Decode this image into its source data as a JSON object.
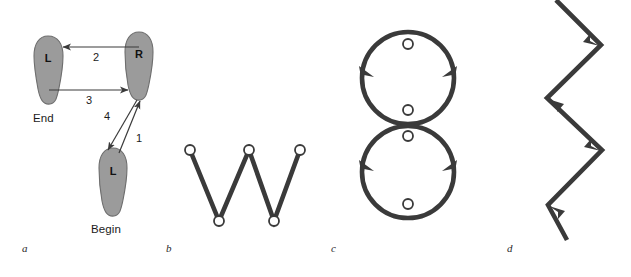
{
  "figure": {
    "title": "",
    "background": "#ffffff",
    "panels": [
      {
        "id": "a",
        "label": "a",
        "type": "footprint-gait-diagram",
        "description": "Two-footprint stepping sequence with four numbered movement arrows",
        "footprints": [
          {
            "name": "left-foot-end",
            "letter": "L",
            "caption": "End",
            "x": 48,
            "y": 68
          },
          {
            "name": "right-foot",
            "letter": "R",
            "caption": "",
            "x": 140,
            "y": 63
          },
          {
            "name": "left-foot-begin",
            "letter": "L",
            "caption": "Begin",
            "x": 113,
            "y": 180
          }
        ],
        "captions": [
          {
            "name": "end-caption",
            "text": "End"
          },
          {
            "name": "begin-caption",
            "text": "Begin"
          }
        ],
        "arrows": [
          {
            "name": "arrow-1",
            "number": "1",
            "from": "left-foot-begin",
            "to": "right-foot",
            "direction": "up-right"
          },
          {
            "name": "arrow-2",
            "number": "2",
            "from": "right-foot",
            "to": "left-foot-end",
            "direction": "left"
          },
          {
            "name": "arrow-3",
            "number": "3",
            "from": "left-foot-end",
            "to": "right-foot",
            "direction": "right"
          },
          {
            "name": "arrow-4",
            "number": "4",
            "from": "right-foot",
            "to": "left-foot-begin",
            "direction": "down-left"
          }
        ],
        "foot_fill": "#9b9b9b",
        "foot_stroke": "#6a6a6a",
        "arrow_color": "#3a3a3a"
      },
      {
        "id": "b",
        "label": "b",
        "type": "zigzag-with-nodes",
        "description": "W-shaped zigzag path with five open circular nodes",
        "nodes": [
          {
            "name": "node-1",
            "x": 190,
            "y": 150
          },
          {
            "name": "node-2",
            "x": 219,
            "y": 221
          },
          {
            "name": "node-3",
            "x": 249,
            "y": 150
          },
          {
            "name": "node-4",
            "x": 274,
            "y": 221
          },
          {
            "name": "node-5",
            "x": 300,
            "y": 150
          }
        ],
        "stroke": "#3a3a3a",
        "stroke_width": 4.5,
        "node_radius": 5
      },
      {
        "id": "c",
        "label": "c",
        "type": "figure-eight-loops",
        "description": "Two stacked circular loops forming a figure-eight with directional arrowheads",
        "loops": [
          {
            "name": "upper-loop",
            "cx": 408,
            "cy": 78,
            "r": 46
          },
          {
            "name": "lower-loop",
            "cx": 408,
            "cy": 172,
            "r": 46
          }
        ],
        "nodes": [
          {
            "name": "node-upper-top",
            "x": 408,
            "y": 44
          },
          {
            "name": "node-upper-bottom",
            "x": 408,
            "y": 110
          },
          {
            "name": "node-lower-top",
            "x": 408,
            "y": 136
          },
          {
            "name": "node-lower-bottom",
            "x": 408,
            "y": 204
          }
        ],
        "arrowheads": [
          {
            "name": "arrowhead-upper-left",
            "direction": "up"
          },
          {
            "name": "arrowhead-upper-right",
            "direction": "up"
          },
          {
            "name": "arrowhead-lower-left",
            "direction": "up"
          },
          {
            "name": "arrowhead-lower-right",
            "direction": "up"
          }
        ],
        "stroke": "#3a3a3a",
        "stroke_width": 4.5,
        "node_radius": 5
      },
      {
        "id": "d",
        "label": "d",
        "type": "zigzag-arrow-path",
        "description": "Vertical zigzag path with upward-pointing arrowheads at each turn",
        "vertices": [
          {
            "name": "vertex-1",
            "x": 561,
            "y": 232
          },
          {
            "name": "vertex-2",
            "x": 548,
            "y": 205
          },
          {
            "name": "vertex-3",
            "x": 602,
            "y": 150
          },
          {
            "name": "vertex-4",
            "x": 547,
            "y": 98
          },
          {
            "name": "vertex-5",
            "x": 601,
            "y": 45
          },
          {
            "name": "vertex-6",
            "x": 556,
            "y": 2
          }
        ],
        "arrowheads": [
          {
            "name": "arrowhead-lower",
            "direction": "up-left"
          },
          {
            "name": "arrowhead-mid-low",
            "direction": "up-right"
          },
          {
            "name": "arrowhead-mid-high",
            "direction": "up-left"
          },
          {
            "name": "arrowhead-upper",
            "direction": "up-right"
          }
        ],
        "stroke": "#3a3a3a",
        "stroke_width": 4.5
      }
    ]
  }
}
